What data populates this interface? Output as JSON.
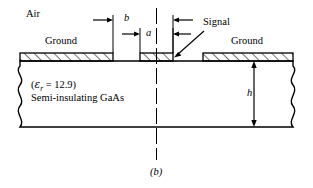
{
  "figure": {
    "caption": "(b)",
    "labels": {
      "air": "Air",
      "ground_left": "Ground",
      "ground_right": "Ground",
      "signal": "Signal",
      "dim_b": "b",
      "dim_a": "a",
      "dim_h": "h",
      "substrate_material": "Semi-insulating GaAs"
    },
    "permittivity": {
      "open_paren": "(",
      "symbol": "ε",
      "subscript": "r",
      "equals": " = ",
      "value": "12.9",
      "close_paren": ")"
    },
    "colors": {
      "stroke": "#000000",
      "background": "#ffffff",
      "hatch": "#000000"
    }
  }
}
